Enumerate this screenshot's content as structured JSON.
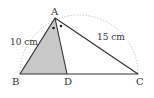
{
  "diagram": {
    "type": "triangle-angle-bisector",
    "points": {
      "A": {
        "label": "A",
        "x": 55,
        "y": 18
      },
      "B": {
        "label": "B",
        "x": 20,
        "y": 74
      },
      "C": {
        "label": "C",
        "x": 138,
        "y": 74
      },
      "D": {
        "label": "D",
        "x": 67,
        "y": 74
      }
    },
    "sides": {
      "AB": {
        "label": "10 cm"
      },
      "AC": {
        "label": "15 cm"
      }
    },
    "shaded_region": "ABD",
    "angle_marks": "equal angles BAD and DAC (dots)",
    "arc": "dotted semicircle over BC",
    "colors": {
      "line": "#333333",
      "shade": "#c8c8c8",
      "arc": "#aaaaaa"
    }
  }
}
